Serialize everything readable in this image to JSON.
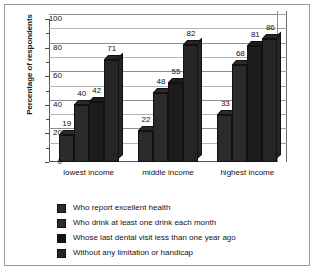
{
  "chart_data": {
    "type": "bar",
    "title": "",
    "xlabel": "",
    "ylabel": "Percentage of respondents",
    "ylim": [
      0,
      100
    ],
    "yticks": [
      0,
      20,
      40,
      60,
      80,
      100
    ],
    "ytick_labels": [
      "0",
      "20",
      "40",
      "60",
      "80",
      "100"
    ],
    "minor_yticks": [
      10,
      30,
      50,
      70,
      90
    ],
    "grid": true,
    "grid_axis": "y",
    "legend_position": "below",
    "style": "3d-grouped-bar",
    "categories": [
      "lowest income",
      "middle income",
      "highest income"
    ],
    "series": [
      {
        "name": "Who report excellent health",
        "color": "#2b2b2b",
        "values": [
          19,
          22,
          33
        ]
      },
      {
        "name": "Who drink at least one drink each month",
        "color": "#2b2b2b",
        "values": [
          40,
          48,
          68
        ]
      },
      {
        "name": "Whose last dental visit less than one year ago",
        "color": "#1c1c1c",
        "values": [
          42,
          55,
          81
        ]
      },
      {
        "name": "Without any limitation or handicap",
        "color": "#252525",
        "values": [
          71,
          82,
          86
        ]
      }
    ]
  },
  "legend": {
    "items": [
      {
        "label": "Who report excellent health",
        "color": "#2b2b2b"
      },
      {
        "label": "Who drink at least one drink each month",
        "color": "#2b2b2b"
      },
      {
        "label": "Whose last dental visit less than one year ago",
        "color": "#141414"
      },
      {
        "label": "Without any limitation or handicap",
        "color": "#252525"
      }
    ]
  }
}
